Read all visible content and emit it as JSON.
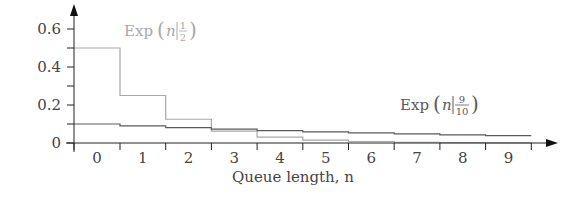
{
  "chart_data": {
    "type": "line",
    "step": true,
    "title": "",
    "xlabel": "Queue length, n",
    "ylabel": "",
    "x": [
      0,
      1,
      2,
      3,
      4,
      5,
      6,
      7,
      8,
      9
    ],
    "xtick_labels": [
      "0",
      "1",
      "2",
      "3",
      "4",
      "5",
      "6",
      "7",
      "8",
      "9"
    ],
    "yticks": [
      0,
      0.1,
      0.2,
      0.3,
      0.4,
      0.5,
      0.6
    ],
    "ytick_labels": [
      {
        "value": 0.6,
        "label": "0.6"
      },
      {
        "value": 0.4,
        "label": "0.4"
      },
      {
        "value": 0.2,
        "label": "0.2"
      },
      {
        "value": 0,
        "label": "0"
      }
    ],
    "ylim": [
      0,
      0.65
    ],
    "xlim": [
      -0.5,
      10.0
    ],
    "grid": false,
    "legend": "inline labels",
    "series": [
      {
        "name": "Exp (n|1/2)",
        "label_main": "Exp",
        "label_arg": "n",
        "label_num": "1",
        "label_den": "2",
        "color": "#a8a8a8",
        "values": [
          0.5,
          0.25,
          0.125,
          0.0625,
          0.03125,
          0.015625,
          0.0078,
          0.0039,
          0.002,
          0.001
        ]
      },
      {
        "name": "Exp (n|9/10)",
        "label_main": "Exp",
        "label_arg": "n",
        "label_num": "9",
        "label_den": "10",
        "color": "#5a5a5a",
        "values": [
          0.1,
          0.09,
          0.081,
          0.0729,
          0.0656,
          0.059,
          0.0531,
          0.0478,
          0.043,
          0.0387
        ]
      }
    ]
  }
}
